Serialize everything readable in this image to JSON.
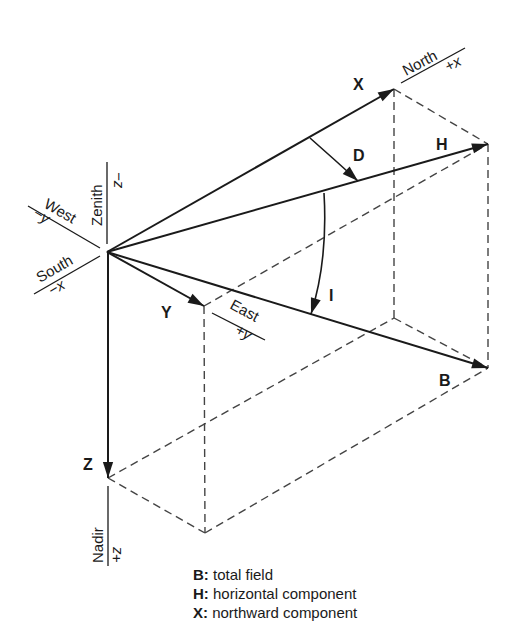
{
  "diagram": {
    "vectors": {
      "X": "X",
      "Y": "Y",
      "Z": "Z",
      "H": "H",
      "B": "B"
    },
    "angles": {
      "D": "D",
      "I": "I"
    },
    "directions": {
      "north": "North",
      "north_axis": "+x",
      "south": "South",
      "south_axis": "−x",
      "east": "East",
      "east_axis": "+y",
      "west": "West",
      "west_axis": "−y",
      "zenith": "Zenith",
      "zenith_axis": "−z",
      "nadir": "Nadir",
      "nadir_axis": "+z"
    },
    "colors": {
      "line": "#1a1a1a",
      "dashed": "#444444",
      "background": "#ffffff"
    }
  },
  "legend": [
    {
      "key": "B:",
      "text": " total field"
    },
    {
      "key": "H:",
      "text": " horizontal component"
    },
    {
      "key": "X:",
      "text": " northward component"
    }
  ]
}
